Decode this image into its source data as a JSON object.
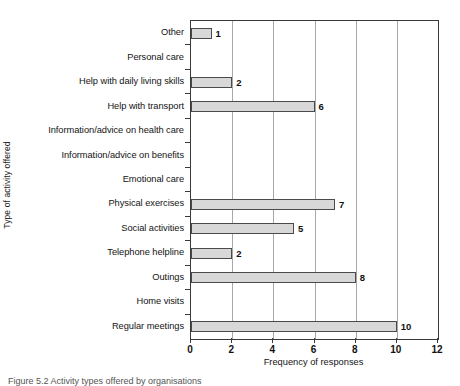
{
  "figure": {
    "caption": "Figure 5.2 Activity types offered by organisations",
    "caption_prefix": "Figure 5.2"
  },
  "chart_data": {
    "type": "bar",
    "orientation": "horizontal",
    "title": "",
    "xlabel": "Frequency of responses",
    "ylabel": "Type of activity offered",
    "xlim": [
      0,
      12
    ],
    "xticks": [
      "0",
      "2",
      "4",
      "6",
      "8",
      "10",
      "12"
    ],
    "grid": "vertical",
    "legend": "none",
    "categories": [
      "Other",
      "Personal care",
      "Help with daily living skills",
      "Help with transport",
      "Information/advice on health care",
      "Information/advice on benefits",
      "Emotional care",
      "Physical exercises",
      "Social activities",
      "Telephone helpline",
      "Outings",
      "Home visits",
      "Regular meetings"
    ],
    "values": [
      1,
      0,
      2,
      6,
      0,
      0,
      0,
      7,
      5,
      2,
      8,
      0,
      10
    ],
    "value_labels": [
      "1",
      "",
      "2",
      "6",
      "",
      "",
      "",
      "7",
      "5",
      "2",
      "8",
      "",
      "10"
    ],
    "colors": {
      "bar_fill": "#d8d8d8",
      "bar_border": "#4a4a4a",
      "axis": "#3a3a3a",
      "gridline": "#a8a8a8",
      "text": "#141414"
    }
  }
}
